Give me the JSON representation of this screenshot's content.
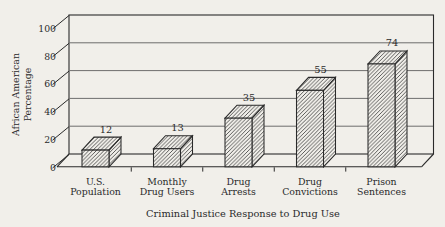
{
  "figure": {
    "colors": {
      "paper": "#f1efea",
      "ink": "#2a2a2a",
      "grid": "#5f5f5f"
    }
  },
  "chart_data": {
    "type": "bar",
    "style": "pseudo-3d-hatched-bars",
    "title": "",
    "xlabel": "Criminal Justice Response to Drug Use",
    "ylabel": "African American Percentage",
    "ylabel_lines": [
      "African American",
      "Percentage"
    ],
    "categories": [
      "U.S. Population",
      "Monthly Drug Users",
      "Drug Arrests",
      "Drug Convictions",
      "Prison Sentences"
    ],
    "category_lines": [
      [
        "U.S.",
        "Population"
      ],
      [
        "Monthly",
        "Drug Users"
      ],
      [
        "Drug",
        "Arrests"
      ],
      [
        "Drug",
        "Convictions"
      ],
      [
        "Prison",
        "Sentences"
      ]
    ],
    "values": [
      12,
      13,
      35,
      55,
      74
    ],
    "value_labels": [
      "12",
      "13",
      "35",
      "55",
      "74"
    ],
    "y_ticks": [
      0,
      20,
      40,
      60,
      80,
      100
    ],
    "ylim": [
      0,
      100
    ],
    "grid": true,
    "legend": null
  }
}
